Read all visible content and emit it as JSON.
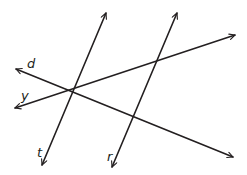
{
  "diagram": {
    "title": "",
    "stroke_color": "#231f20",
    "background": "#ffffff",
    "lines": [
      {
        "name": "t",
        "x1": 106,
        "y1": 13,
        "x2": 42,
        "y2": 165,
        "arrows": "both"
      },
      {
        "name": "r",
        "x1": 177,
        "y1": 13,
        "x2": 112,
        "y2": 167,
        "arrows": "both"
      },
      {
        "name": "d",
        "x1": 16,
        "y1": 69,
        "x2": 233,
        "y2": 157,
        "arrows": "both"
      },
      {
        "name": "y",
        "x1": 15,
        "y1": 108,
        "x2": 235,
        "y2": 35,
        "arrows": "both"
      }
    ],
    "labels": {
      "d": "d",
      "y": "y",
      "t": "t",
      "r": "r"
    },
    "intersection_point": {
      "x": 75,
      "y": 89,
      "lines": [
        "t",
        "d",
        "y"
      ]
    }
  }
}
